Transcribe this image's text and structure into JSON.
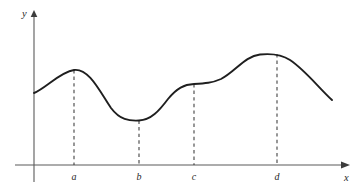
{
  "figure": {
    "title": "",
    "background_color": "#ffffff",
    "width": 362,
    "height": 191
  },
  "axes": {
    "x_axis": {
      "label": "x",
      "label_x": 348,
      "label_y": 180,
      "line_y": 165,
      "line_x_start": 15,
      "line_x_end": 344,
      "arrow_tip_x": 350,
      "color": "#5a5a5a"
    },
    "y_axis": {
      "label": "y",
      "label_x": 26,
      "label_y": 17,
      "line_x": 34,
      "line_y_start": 16,
      "line_y_end": 182,
      "arrow_tip_y": 10,
      "color": "#5a5a5a"
    }
  },
  "tick_labels": [
    {
      "name": "a",
      "text": "a",
      "x": 74,
      "y": 180
    },
    {
      "name": "b",
      "text": "b",
      "x": 139,
      "y": 180
    },
    {
      "name": "c",
      "text": "c",
      "x": 194,
      "y": 180
    },
    {
      "name": "d",
      "text": "d",
      "x": 277,
      "y": 180
    }
  ],
  "dashed_guides": [
    {
      "name": "guide-a",
      "x": 74,
      "y_top": 70,
      "y_bottom": 165,
      "color": "#3a3a3a"
    },
    {
      "name": "guide-b",
      "x": 139,
      "y_top": 120,
      "y_bottom": 165,
      "color": "#3a3a3a"
    },
    {
      "name": "guide-c",
      "x": 194,
      "y_top": 84,
      "y_bottom": 165,
      "color": "#3a3a3a"
    },
    {
      "name": "guide-d",
      "x": 277,
      "y_top": 54,
      "y_bottom": 165,
      "color": "#3a3a3a"
    }
  ],
  "curve": {
    "color": "#1f1f1f",
    "stroke_width": 1.9,
    "path": "M 34,93 C 46,88 60,72 74,70 C 89,68 100,92 111,108 C 120,120 129,121 139,120.5 C 151,120 159,111 168,99 C 177,88 184,84.5 194,84 C 205,83.5 212,83 221,79 C 235,72 245,56 260,54.5 C 271,53.4 281,54 290,60 C 305,70 318,87 332,100",
    "points": [
      {
        "label": "start",
        "x": 34,
        "y": 93,
        "kind": "endpoint"
      },
      {
        "label": "a",
        "x": 74,
        "y": 70,
        "kind": "local-maximum"
      },
      {
        "label": "b",
        "x": 139,
        "y": 120.5,
        "kind": "local-minimum"
      },
      {
        "label": "c",
        "x": 194,
        "y": 84,
        "kind": "inflection-plateau"
      },
      {
        "label": "d",
        "x": 277,
        "y": 54,
        "kind": "local-maximum"
      },
      {
        "label": "end",
        "x": 332,
        "y": 100,
        "kind": "endpoint"
      }
    ]
  },
  "chart_data": {
    "type": "line",
    "title": "",
    "xlabel": "x",
    "ylabel": "y",
    "grid": false,
    "legend": null,
    "xlim": [
      34,
      332
    ],
    "ylim": [
      0,
      165
    ],
    "x_tick_labels": [
      "a",
      "b",
      "c",
      "d"
    ],
    "x_tick_positions": [
      74,
      139,
      194,
      277
    ],
    "y_tick_labels": [],
    "annotations": [
      {
        "at": "a",
        "note": "local maximum"
      },
      {
        "at": "b",
        "note": "local minimum"
      },
      {
        "at": "c",
        "note": "flat inflection point"
      },
      {
        "at": "d",
        "note": "absolute maximum"
      }
    ],
    "series": [
      {
        "name": "f",
        "x": [
          34,
          74,
          139,
          194,
          277,
          332
        ],
        "y_pixel": [
          93,
          70,
          120.5,
          84,
          54,
          100
        ],
        "y_relative": [
          72,
          95,
          44.5,
          81,
          111,
          65
        ]
      }
    ]
  }
}
